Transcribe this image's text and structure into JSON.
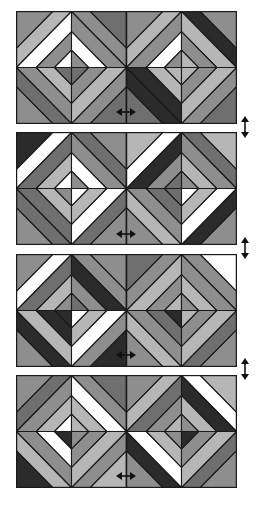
{
  "colors": {
    "K": "#2b2b2b",
    "D": "#6f6f6f",
    "M": "#8e8e8e",
    "L": "#b6b6b6",
    "W": "#ffffff",
    "stroke": "#1a1a1a"
  },
  "geometry": {
    "block_width": 110,
    "block_height": 112,
    "outer_band_t": 0.66,
    "inner_band_t": 1.36,
    "small_diamond_radius": 17
  },
  "panels": [
    {
      "top": 11,
      "blocks": [
        {
          "q": [
            [
              "M",
              "L",
              "W",
              "W",
              "M",
              "W"
            ],
            [
              "D",
              "M",
              "M",
              "M",
              "W",
              "M"
            ],
            [
              "M",
              "D",
              "M",
              "D",
              "L",
              "D"
            ],
            [
              "D",
              "M",
              "L",
              "L",
              "M",
              "D"
            ]
          ]
        },
        {
          "q": [
            [
              "M",
              "L",
              "M",
              "M",
              "W",
              "M"
            ],
            [
              "M",
              "K",
              "L",
              "L",
              "M",
              "L"
            ],
            [
              "D",
              "K",
              "K",
              "K",
              "L",
              "L"
            ],
            [
              "D",
              "M",
              "L",
              "L",
              "M",
              "L"
            ]
          ]
        }
      ]
    },
    {
      "top": 132,
      "blocks": [
        {
          "q": [
            [
              "K",
              "W",
              "D",
              "D",
              "L",
              "W"
            ],
            [
              "M",
              "D",
              "M",
              "M",
              "W",
              "M"
            ],
            [
              "M",
              "D",
              "D",
              "D",
              "L",
              "M"
            ],
            [
              "M",
              "D",
              "W",
              "W",
              "L",
              "W"
            ]
          ]
        },
        {
          "q": [
            [
              "L",
              "W",
              "K",
              "K",
              "M",
              "D"
            ],
            [
              "L",
              "D",
              "M",
              "M",
              "L",
              "M"
            ],
            [
              "M",
              "L",
              "M",
              "M",
              "D",
              "D"
            ],
            [
              "M",
              "K",
              "W",
              "W",
              "L",
              "W"
            ]
          ]
        }
      ]
    },
    {
      "top": 254,
      "blocks": [
        {
          "q": [
            [
              "M",
              "W",
              "D",
              "D",
              "L",
              "M"
            ],
            [
              "M",
              "M",
              "K",
              "K",
              "M",
              "D"
            ],
            [
              "M",
              "K",
              "L",
              "L",
              "K",
              "K"
            ],
            [
              "K",
              "M",
              "W",
              "W",
              "L",
              "W"
            ]
          ]
        },
        {
          "q": [
            [
              "D",
              "M",
              "L",
              "L",
              "M",
              "L"
            ],
            [
              "W",
              "M",
              "M",
              "M",
              "L",
              "M"
            ],
            [
              "M",
              "L",
              "M",
              "M",
              "D",
              "K"
            ],
            [
              "M",
              "D",
              "L",
              "L",
              "M",
              "L"
            ]
          ]
        }
      ]
    },
    {
      "top": 375,
      "blocks": [
        {
          "q": [
            [
              "M",
              "D",
              "M",
              "M",
              "L",
              "W"
            ],
            [
              "D",
              "M",
              "W",
              "W",
              "L",
              "L"
            ],
            [
              "K",
              "L",
              "M",
              "M",
              "W",
              "K"
            ],
            [
              "L",
              "M",
              "L",
              "L",
              "M",
              "M"
            ]
          ]
        },
        {
          "q": [
            [
              "M",
              "L",
              "D",
              "D",
              "M",
              "L"
            ],
            [
              "L",
              "W",
              "K",
              "K",
              "L",
              "M"
            ],
            [
              "M",
              "K",
              "W",
              "W",
              "L",
              "M"
            ],
            [
              "M",
              "D",
              "L",
              "L",
              "M",
              "K"
            ]
          ]
        }
      ]
    }
  ],
  "arrows": {
    "vertical": [
      {
        "name": "swap-panels-1-2",
        "top": 116
      },
      {
        "name": "swap-panels-2-3",
        "top": 237
      },
      {
        "name": "swap-panels-3-4",
        "top": 358
      }
    ],
    "horizontal": [
      {
        "name": "flip-panel-1",
        "left": 116,
        "top": 102
      },
      {
        "name": "flip-panel-2",
        "left": 116,
        "top": 224
      },
      {
        "name": "flip-panel-3",
        "left": 116,
        "top": 345
      },
      {
        "name": "flip-panel-4",
        "left": 116,
        "top": 466
      }
    ]
  }
}
